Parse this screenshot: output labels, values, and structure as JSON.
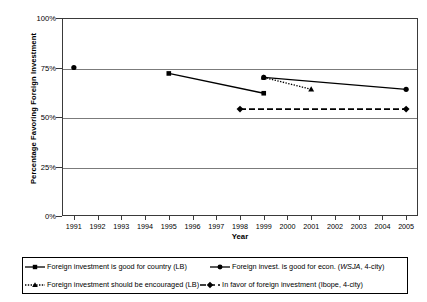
{
  "chart_data": {
    "type": "line",
    "title": "",
    "xlabel": "Year",
    "ylabel": "Percentage Favoring Foreign Investment",
    "xlim": [
      1990.5,
      2005.5
    ],
    "ylim": [
      0,
      100
    ],
    "yticks": [
      "0%",
      "25%",
      "50%",
      "75%",
      "100%"
    ],
    "ytick_values": [
      0,
      25,
      50,
      75,
      100
    ],
    "xticks": [
      "1991",
      "1992",
      "1993",
      "1994",
      "1995",
      "1996",
      "1997",
      "1998",
      "1999",
      "2000",
      "2001",
      "2002",
      "2003",
      "2004",
      "2005"
    ],
    "xtick_values": [
      1991,
      1992,
      1993,
      1994,
      1995,
      1996,
      1997,
      1998,
      1999,
      2000,
      2001,
      2002,
      2003,
      2004,
      2005
    ],
    "grid": "horizontal",
    "legend_position": "bottom",
    "series": [
      {
        "name": "Foreign investment is good for country (LB)",
        "marker": "square",
        "linestyle": "solid",
        "color": "#000000",
        "x": [
          1995,
          1999
        ],
        "values": [
          72,
          62
        ]
      },
      {
        "name": "Foreign invest. is good for econ. (WSJA, 4-city)",
        "marker": "circle",
        "linestyle": "solid",
        "color": "#000000",
        "x": [
          1991,
          1999,
          2005
        ],
        "values": [
          75,
          70,
          64
        ],
        "segments": [
          [
            1991,
            1991
          ],
          [
            1999,
            2005
          ]
        ]
      },
      {
        "name": "Foreign investment should be encouraged (LB)",
        "marker": "triangle",
        "linestyle": "dotted",
        "color": "#000000",
        "x": [
          1999,
          2001
        ],
        "values": [
          70,
          64
        ]
      },
      {
        "name": "In favor of foreign investment (Ibope, 4-city)",
        "marker": "diamond",
        "linestyle": "dashed",
        "color": "#000000",
        "x": [
          1998,
          2005
        ],
        "values": [
          54,
          54
        ]
      }
    ]
  },
  "axes": {
    "y_title": "Percentage Favoring Foreign Investment",
    "x_title": "Year",
    "y_labels": [
      "100%",
      "75%",
      "50%",
      "25%",
      "0%"
    ],
    "x_labels": [
      "1991",
      "1992",
      "1993",
      "1994",
      "1995",
      "1996",
      "1997",
      "1998",
      "1999",
      "2000",
      "2001",
      "2002",
      "2003",
      "2004",
      "2005"
    ]
  },
  "legend": {
    "rows": [
      [
        {
          "marker": "square-solid",
          "text_before": "Foreign investment is good for country (LB)",
          "italic": "",
          "text_after": ""
        },
        {
          "marker": "circle-solid",
          "text_before": "Foreign invest. is good for econ. (",
          "italic": "WSJA",
          "text_after": ", 4-city)"
        }
      ],
      [
        {
          "marker": "triangle-dotted",
          "text_before": "Foreign investment should be encouraged (LB)",
          "italic": "",
          "text_after": ""
        },
        {
          "marker": "diamond-dashed",
          "text_before": "In favor of foreign investment (Ibope, 4-city)",
          "italic": "",
          "text_after": ""
        }
      ]
    ]
  }
}
